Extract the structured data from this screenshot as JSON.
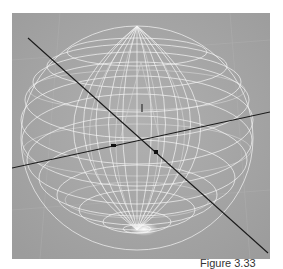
{
  "viewport": {
    "object": "wireframe-sphere",
    "background_color": "#a7a7a7",
    "wire_color": "#ffffff",
    "axis_line_color": "#1a1a1a"
  },
  "caption": {
    "text": "Figure 3.33"
  }
}
